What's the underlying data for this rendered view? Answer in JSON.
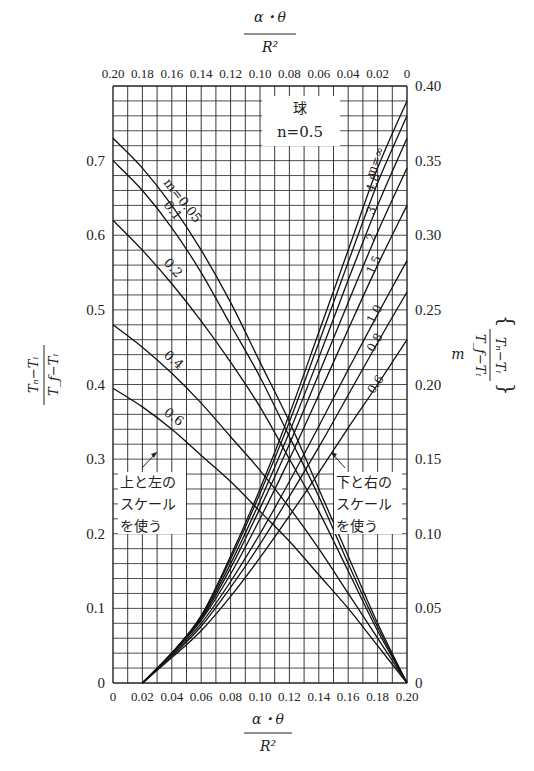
{
  "chart_data": {
    "type": "line",
    "title": "球",
    "subtitle": "n=0.5",
    "x_bottom": {
      "label_numerator": "α・θ",
      "label_denominator": "R²",
      "range": [
        0,
        0.2
      ],
      "ticks": [
        "0",
        "0.02",
        "0.04",
        "0.06",
        "0.08",
        "0.10",
        "0.12",
        "0.14",
        "0.16",
        "0.18",
        "0.20"
      ]
    },
    "x_top": {
      "label_numerator": "α・θ",
      "label_denominator": "R²",
      "range": [
        0.2,
        0
      ],
      "ticks": [
        "0.20",
        "0.18",
        "0.16",
        "0.14",
        "0.12",
        "0.10",
        "0.08",
        "0.06",
        "0.04",
        "0.02",
        "0"
      ]
    },
    "y_left": {
      "label_numerator": "Tₙ−Tᵢ",
      "label_denominator": "T_f−Tᵢ",
      "range": [
        0,
        0.8
      ],
      "ticks": [
        "0",
        "0.1",
        "0.2",
        "0.3",
        "0.4",
        "0.5",
        "0.6",
        "0.7"
      ]
    },
    "y_right": {
      "label_prefix": "m",
      "label_numerator": "Tₙ−Tᵢ",
      "label_denominator": "T_f−Tᵢ",
      "range": [
        0,
        0.4
      ],
      "ticks": [
        "0",
        "0.05",
        "0.10",
        "0.15",
        "0.20",
        "0.25",
        "0.30",
        "0.35",
        "0.40"
      ]
    },
    "grid": true,
    "annotations": {
      "left_scale_note": [
        "上と左の",
        "スケール",
        "を使う"
      ],
      "right_scale_note": [
        "下と右の",
        "スケール",
        "を使う"
      ]
    },
    "series_top_left_scale": [
      {
        "name": "m=0.05",
        "label": "m=0.05",
        "x": [
          0.2,
          0.18,
          0.16,
          0.14,
          0.12,
          0.1,
          0.08,
          0.06,
          0.04,
          0.02,
          0.0
        ],
        "y": [
          0.73,
          0.69,
          0.64,
          0.58,
          0.51,
          0.43,
          0.35,
          0.26,
          0.17,
          0.08,
          0.0
        ]
      },
      {
        "name": "m=0.1",
        "label": "0.1",
        "x": [
          0.2,
          0.18,
          0.16,
          0.14,
          0.12,
          0.1,
          0.08,
          0.06,
          0.04,
          0.02,
          0.0
        ],
        "y": [
          0.7,
          0.66,
          0.61,
          0.55,
          0.48,
          0.41,
          0.33,
          0.25,
          0.16,
          0.075,
          0.0
        ]
      },
      {
        "name": "m=0.2",
        "label": "0.2",
        "x": [
          0.2,
          0.18,
          0.16,
          0.14,
          0.12,
          0.1,
          0.08,
          0.06,
          0.04,
          0.02,
          0.0
        ],
        "y": [
          0.62,
          0.58,
          0.535,
          0.485,
          0.43,
          0.37,
          0.3,
          0.23,
          0.15,
          0.07,
          0.0
        ]
      },
      {
        "name": "m=0.4",
        "label": "0.4",
        "x": [
          0.2,
          0.18,
          0.16,
          0.14,
          0.12,
          0.1,
          0.08,
          0.06,
          0.04,
          0.02,
          0.0
        ],
        "y": [
          0.48,
          0.45,
          0.415,
          0.375,
          0.33,
          0.285,
          0.235,
          0.18,
          0.12,
          0.06,
          0.0
        ]
      },
      {
        "name": "m=0.6",
        "label": "0.6",
        "x": [
          0.2,
          0.18,
          0.16,
          0.14,
          0.12,
          0.1,
          0.08,
          0.06,
          0.04,
          0.02,
          0.0
        ],
        "y": [
          0.395,
          0.37,
          0.34,
          0.305,
          0.27,
          0.23,
          0.19,
          0.145,
          0.1,
          0.05,
          0.0
        ]
      }
    ],
    "series_bottom_right_scale": [
      {
        "name": "m=∞",
        "label": "m=∞",
        "x": [
          0.02,
          0.04,
          0.06,
          0.08,
          0.1,
          0.12,
          0.14,
          0.16,
          0.18,
          0.2
        ],
        "y": [
          0.0,
          0.02,
          0.045,
          0.085,
          0.13,
          0.18,
          0.235,
          0.29,
          0.345,
          0.39
        ]
      },
      {
        "name": "m=4.8",
        "label": "4.8",
        "x": [
          0.02,
          0.04,
          0.06,
          0.08,
          0.1,
          0.12,
          0.14,
          0.16,
          0.18,
          0.2
        ],
        "y": [
          0.0,
          0.02,
          0.045,
          0.083,
          0.127,
          0.175,
          0.228,
          0.282,
          0.335,
          0.38
        ]
      },
      {
        "name": "m=3",
        "label": "3",
        "x": [
          0.02,
          0.04,
          0.06,
          0.08,
          0.1,
          0.12,
          0.14,
          0.16,
          0.18,
          0.2
        ],
        "y": [
          0.0,
          0.02,
          0.044,
          0.08,
          0.122,
          0.168,
          0.218,
          0.27,
          0.32,
          0.365
        ]
      },
      {
        "name": "m=2",
        "label": "2",
        "x": [
          0.02,
          0.04,
          0.06,
          0.08,
          0.1,
          0.12,
          0.14,
          0.16,
          0.18,
          0.2
        ],
        "y": [
          0.0,
          0.02,
          0.043,
          0.077,
          0.117,
          0.16,
          0.207,
          0.255,
          0.302,
          0.345
        ]
      },
      {
        "name": "m=1.5",
        "label": "1.5",
        "x": [
          0.02,
          0.04,
          0.06,
          0.08,
          0.1,
          0.12,
          0.14,
          0.16,
          0.18,
          0.2
        ],
        "y": [
          0.0,
          0.02,
          0.042,
          0.073,
          0.11,
          0.15,
          0.193,
          0.237,
          0.28,
          0.32
        ]
      },
      {
        "name": "m=1.0",
        "label": "1.0",
        "x": [
          0.02,
          0.04,
          0.06,
          0.08,
          0.1,
          0.12,
          0.14,
          0.16,
          0.18,
          0.2
        ],
        "y": [
          0.0,
          0.019,
          0.04,
          0.068,
          0.1,
          0.135,
          0.172,
          0.21,
          0.247,
          0.283
        ]
      },
      {
        "name": "m=0.8",
        "label": "0.8",
        "x": [
          0.02,
          0.04,
          0.06,
          0.08,
          0.1,
          0.12,
          0.14,
          0.16,
          0.18,
          0.2
        ],
        "y": [
          0.0,
          0.018,
          0.038,
          0.064,
          0.093,
          0.125,
          0.158,
          0.193,
          0.228,
          0.262
        ]
      },
      {
        "name": "m=0.6",
        "label": "0.6",
        "x": [
          0.02,
          0.04,
          0.06,
          0.08,
          0.1,
          0.12,
          0.14,
          0.16,
          0.18,
          0.2
        ],
        "y": [
          0.0,
          0.017,
          0.035,
          0.058,
          0.084,
          0.112,
          0.141,
          0.171,
          0.2,
          0.23
        ]
      }
    ]
  }
}
